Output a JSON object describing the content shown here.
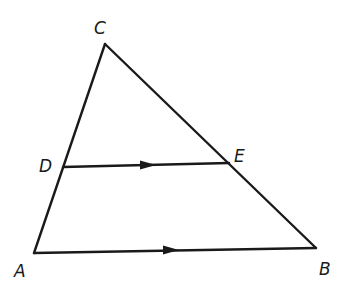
{
  "diagram": {
    "type": "geometry-triangle-with-parallel-segment",
    "stroke_color": "#1a1a1a",
    "background": "#ffffff",
    "points": {
      "A": {
        "x": 34,
        "y": 253,
        "label": "A",
        "label_x": 14,
        "label_y": 277
      },
      "B": {
        "x": 316,
        "y": 248,
        "label": "B",
        "label_x": 319,
        "label_y": 275
      },
      "C": {
        "x": 105,
        "y": 44,
        "label": "C",
        "label_x": 94,
        "label_y": 34
      },
      "D": {
        "x": 63,
        "y": 167,
        "label": "D",
        "label_x": 39,
        "label_y": 172
      },
      "E": {
        "x": 229,
        "y": 163,
        "label": "E",
        "label_x": 234,
        "label_y": 162
      }
    },
    "segments": [
      {
        "from": "A",
        "to": "C",
        "name": "side-AC"
      },
      {
        "from": "C",
        "to": "B",
        "name": "side-CB"
      },
      {
        "from": "A",
        "to": "B",
        "name": "side-AB",
        "arrow_marker": true
      },
      {
        "from": "D",
        "to": "E",
        "name": "segment-DE",
        "arrow_marker": true
      }
    ],
    "parallel_markers": [
      {
        "segment": "DE",
        "x": 152,
        "y": 165
      },
      {
        "segment": "AB",
        "x": 175,
        "y": 250
      }
    ],
    "relation": "DE ∥ AB"
  }
}
